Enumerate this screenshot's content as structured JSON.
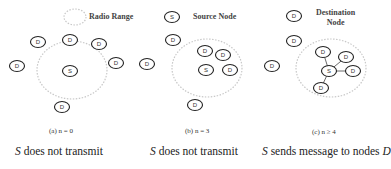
{
  "legend": {
    "radio_range": "Radio Range",
    "source_node": "Source Node",
    "destination_node_line1": "Destination",
    "destination_node_line2": "Node",
    "source_symbol": "S",
    "destination_symbol": "D"
  },
  "panels": [
    {
      "id": "a",
      "subcaption": "(a) n = 0",
      "caption_symbol": "S",
      "caption_text": " does not transmit",
      "caption_tail": "",
      "source": {
        "label": "S",
        "x": 70,
        "y": 71
      },
      "destinations": [
        {
          "label": "D",
          "x": 38,
          "y": 42
        },
        {
          "label": "D",
          "x": 70,
          "y": 40
        },
        {
          "label": "D",
          "x": 99,
          "y": 44
        },
        {
          "label": "D",
          "x": 17,
          "y": 66
        },
        {
          "label": "D",
          "x": 116,
          "y": 63
        },
        {
          "label": "D",
          "x": 62,
          "y": 107
        }
      ],
      "range": {
        "cx": 72,
        "cy": 70,
        "rx": 35,
        "ry": 29
      },
      "links": []
    },
    {
      "id": "b",
      "subcaption": "(b) n = 3",
      "caption_symbol": "S",
      "caption_text": " does not transmit",
      "caption_tail": "",
      "source": {
        "label": "S",
        "x": 206,
        "y": 70
      },
      "destinations": [
        {
          "label": "D",
          "x": 173,
          "y": 40
        },
        {
          "label": "D",
          "x": 205,
          "y": 51
        },
        {
          "label": "D",
          "x": 223,
          "y": 55
        },
        {
          "label": "D",
          "x": 230,
          "y": 70
        },
        {
          "label": "D",
          "x": 147,
          "y": 64
        },
        {
          "label": "D",
          "x": 195,
          "y": 105
        }
      ],
      "range": {
        "cx": 207,
        "cy": 68,
        "rx": 35,
        "ry": 29
      },
      "links": []
    },
    {
      "id": "c",
      "subcaption": "(c) n ≥ 4",
      "caption_symbol": "S",
      "caption_text": " sends message to nodes ",
      "caption_tail": "D",
      "source": {
        "label": "S",
        "x": 329,
        "y": 71
      },
      "destinations": [
        {
          "label": "D",
          "x": 294,
          "y": 41
        },
        {
          "label": "D",
          "x": 323,
          "y": 52
        },
        {
          "label": "D",
          "x": 346,
          "y": 57
        },
        {
          "label": "D",
          "x": 353,
          "y": 71
        },
        {
          "label": "D",
          "x": 272,
          "y": 66
        },
        {
          "label": "D",
          "x": 321,
          "y": 88
        }
      ],
      "range": {
        "cx": 331,
        "cy": 68,
        "rx": 35,
        "ry": 29
      },
      "links": [
        1,
        2,
        3,
        5
      ]
    }
  ],
  "legend_symbols": {
    "radio_range": {
      "cx": 75,
      "cy": 17,
      "rx": 11,
      "ry": 8
    },
    "source": {
      "x": 172,
      "y": 17
    },
    "destination": {
      "x": 294,
      "y": 16
    }
  },
  "colors": {
    "node_stroke": "#222222",
    "range_stroke": "#c8c8c8",
    "link": "#444444"
  }
}
